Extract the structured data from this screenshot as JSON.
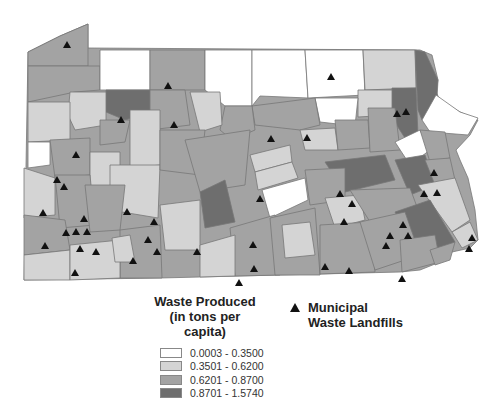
{
  "legend": {
    "title_line1": "Waste Produced",
    "title_line2": "(in tons per capita)",
    "classes": [
      {
        "label": "0.0003 - 0.3500",
        "color": "#ffffff"
      },
      {
        "label": "0.3501 - 0.6200",
        "color": "#d4d4d4"
      },
      {
        "label": "0.6201 - 0.8700",
        "color": "#a3a3a3"
      },
      {
        "label": "0.8701 - 1.5740",
        "color": "#6e6e6e"
      }
    ]
  },
  "landfill_legend": {
    "symbol": "triangle",
    "line1": "Municipal",
    "line2": "Waste Landfills"
  }
}
